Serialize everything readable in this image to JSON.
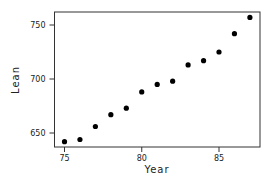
{
  "chart_data": {
    "type": "scatter",
    "title": "",
    "xlabel": "Year",
    "ylabel": "Lean",
    "x": [
      75,
      76,
      77,
      78,
      79,
      80,
      81,
      82,
      83,
      84,
      85,
      86,
      87
    ],
    "series": [
      {
        "name": "Lean",
        "values": [
          642,
          644,
          656,
          667,
          673,
          688,
          695,
          698,
          713,
          717,
          725,
          742,
          757
        ]
      }
    ],
    "xlim": [
      74.4,
      87.7
    ],
    "ylim": [
      637,
      762
    ],
    "xticks": [
      75,
      80,
      85
    ],
    "xtick_labels": [
      "75",
      "80",
      "85"
    ],
    "yticks": [
      650,
      700,
      750
    ],
    "ytick_labels": [
      "650",
      "700",
      "750"
    ],
    "grid": false,
    "legend": null,
    "marker": "filled-circle",
    "colors": {
      "marker": "#000000",
      "axis": "#333333"
    }
  }
}
